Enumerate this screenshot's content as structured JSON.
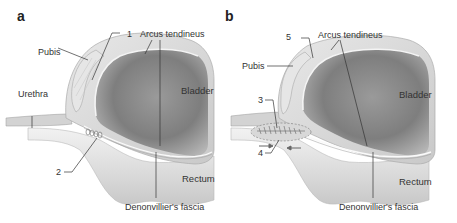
{
  "figure": {
    "panels": [
      {
        "letter": "a",
        "labels": {
          "pubis": "Pubis",
          "num1": "1",
          "arcus": "Arcus tendineus",
          "urethra": "Urethra",
          "bladder": "Bladder",
          "num2": "2",
          "rectum": "Rectum",
          "fascia": "Denonvillier's fascia"
        }
      },
      {
        "letter": "b",
        "labels": {
          "num5": "5",
          "arcus": "Arcus tendineus",
          "pubis": "Pubis",
          "bladder": "Bladder",
          "num3": "3",
          "num4": "4",
          "rectum": "Rectum",
          "fascia": "Denonvillier's fascia"
        }
      }
    ],
    "colors": {
      "bladder_interior": "#8c8c8c",
      "bladder_wall": "#d9d9d9",
      "rectum": "#e2e2e2",
      "leader_line": "#333333",
      "text": "#333333"
    }
  }
}
